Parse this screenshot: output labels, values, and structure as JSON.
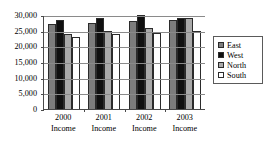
{
  "chart_data": {
    "type": "bar",
    "title": "",
    "subtitle": "",
    "xlabel": "",
    "ylabel": "",
    "categories": [
      "2000 Income",
      "2001 Income",
      "2002 Income",
      "2003 Income"
    ],
    "category_lines": [
      {
        "line1": "2000",
        "line2": "Income"
      },
      {
        "line1": "2001",
        "line2": "Income"
      },
      {
        "line1": "2002",
        "line2": "Income"
      },
      {
        "line1": "2003",
        "line2": "Income"
      }
    ],
    "series": [
      {
        "name": "East",
        "color": "#7d7d7d",
        "values": [
          27000,
          27500,
          28000,
          28500
        ]
      },
      {
        "name": "West",
        "color": "#101010",
        "values": [
          28500,
          29000,
          30000,
          29000
        ]
      },
      {
        "name": "North",
        "color": "#a9a9a9",
        "values": [
          24000,
          25000,
          26000,
          29000
        ]
      },
      {
        "name": "South",
        "color": "#ffffff",
        "values": [
          23000,
          24000,
          24200,
          25000
        ]
      }
    ],
    "ylim": [
      0,
      30000
    ],
    "ytick_values": [
      0,
      5000,
      10000,
      15000,
      20000,
      25000,
      30000
    ],
    "ytick_labels": [
      "0",
      "5,000",
      "10,000",
      "15,000",
      "20,000",
      "25,000",
      "30,000"
    ],
    "grid": true,
    "grid_axis": "y",
    "legend_position": "right",
    "legend_entries": [
      "East",
      "West",
      "North",
      "South"
    ]
  },
  "legend": {
    "items": [
      {
        "label": "East"
      },
      {
        "label": "West"
      },
      {
        "label": "North"
      },
      {
        "label": "South"
      }
    ]
  },
  "colors": {
    "east": "#7d7d7d",
    "west": "#101010",
    "north": "#a9a9a9",
    "south": "#ffffff",
    "axis": "#4a4a4a",
    "grid": "#8a8a8a",
    "background": "#ffffff",
    "text": "#000000"
  }
}
